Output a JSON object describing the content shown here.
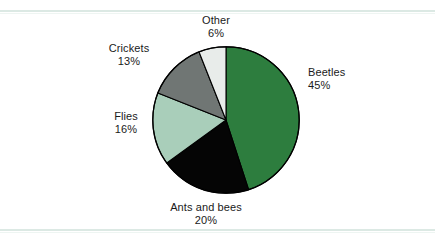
{
  "chart_data": {
    "type": "pie",
    "title": "",
    "subtitle": "",
    "xlabel": "",
    "ylabel": "",
    "legend_position": "none",
    "grid": false,
    "start_angle_deg": 0,
    "direction": "clockwise",
    "unit": "%",
    "categories": [
      "Beetles",
      "Ants and bees",
      "Flies",
      "Crickets",
      "Other"
    ],
    "values": [
      45,
      20,
      16,
      13,
      6
    ],
    "colors": [
      "#2d7d3e",
      "#050505",
      "#a9ceba",
      "#707674",
      "#e8ecea"
    ],
    "slices": [
      {
        "label": "Beetles",
        "value": 45,
        "value_text": "45%",
        "color": "#2d7d3e"
      },
      {
        "label": "Ants and bees",
        "value": 20,
        "value_text": "20%",
        "color": "#050505"
      },
      {
        "label": "Flies",
        "value": 16,
        "value_text": "16%",
        "color": "#a9ceba"
      },
      {
        "label": "Crickets",
        "value": 13,
        "value_text": "13%",
        "color": "#707674"
      },
      {
        "label": "Other",
        "value": 6,
        "value_text": "6%",
        "color": "#e8ecea"
      }
    ]
  },
  "figure": {
    "background": "#ffffff",
    "rule_color": "#dce9e4",
    "outline_color": "#000000",
    "text_color": "#1a1a1a"
  }
}
